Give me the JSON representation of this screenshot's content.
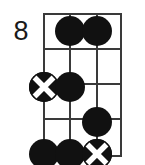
{
  "diagram": {
    "kind": "guitar-chord-diagram",
    "position_label": "8",
    "strings": 4,
    "frets": 5,
    "starting_fret": 8,
    "colors": {
      "background": "#ffffff",
      "grid": "#3a3a3a",
      "marker_fill": "#111111",
      "marker_cross": "#ffffff",
      "label_text": "#1a1a1a"
    },
    "string_positions": [
      0,
      26,
      53,
      78
    ],
    "fret_positions": [
      0,
      35,
      70,
      105,
      142
    ],
    "markers": [
      {
        "name": "marker-fret1-string2",
        "type": "dot",
        "string": 2,
        "fret": 1,
        "x": 26,
        "y": 18
      },
      {
        "name": "marker-fret1-string3",
        "type": "dot",
        "string": 3,
        "fret": 1,
        "x": 53,
        "y": 18
      },
      {
        "name": "marker-fret3-string1",
        "type": "crossed-dot",
        "string": 1,
        "fret": 3,
        "x": 0,
        "y": 74
      },
      {
        "name": "marker-fret3-string2",
        "type": "dot",
        "string": 2,
        "fret": 2,
        "x": 26,
        "y": 74
      },
      {
        "name": "marker-fret4-string3",
        "type": "dot",
        "string": 3,
        "fret": 4,
        "x": 53,
        "y": 109
      },
      {
        "name": "marker-fret5-string1",
        "type": "dot",
        "string": 1,
        "fret": 5,
        "x": 0,
        "y": 141
      },
      {
        "name": "marker-fret5-string2",
        "type": "dot",
        "string": 2,
        "fret": 5,
        "x": 26,
        "y": 141
      },
      {
        "name": "marker-fret5-string3",
        "type": "crossed-dot",
        "string": 3,
        "fret": 5,
        "x": 53,
        "y": 141
      }
    ]
  }
}
